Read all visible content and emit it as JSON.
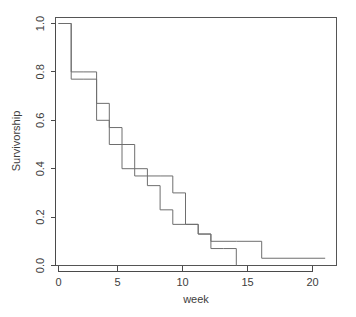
{
  "figure": {
    "name": "survivorship-kaplan-meier-plot",
    "background_color": "#ffffff",
    "line_color": "#6e6e6e",
    "axis_color": "#4a4a4a",
    "width": 356,
    "height": 317
  },
  "chart_data": {
    "type": "line",
    "subtype": "kaplan-meier-step",
    "title": "",
    "subtitle": "",
    "xlabel": "week",
    "ylabel": "Survivorship",
    "xlim": [
      0,
      21.8
    ],
    "ylim": [
      0.0,
      1.0
    ],
    "xticks": [
      0,
      5,
      10,
      15,
      20
    ],
    "xtick_labels": [
      "0",
      "5",
      "10",
      "15",
      "20"
    ],
    "yticks": [
      0.0,
      0.2,
      0.4,
      0.6,
      0.8,
      1.0
    ],
    "ytick_labels": [
      "0.0",
      "0.2",
      "0.4",
      "0.6",
      "0.8",
      "1.0"
    ],
    "grid": false,
    "legend": false,
    "legend_position": "none",
    "series": [
      {
        "name": "group-a",
        "color": "#6e6e6e",
        "step": "post",
        "x": [
          0,
          1,
          2,
          3,
          4,
          5,
          6,
          8,
          9,
          10,
          11,
          12,
          14,
          16,
          21
        ],
        "y": [
          1.0,
          0.8,
          0.8,
          0.67,
          0.57,
          0.5,
          0.37,
          0.37,
          0.3,
          0.17,
          0.13,
          0.1,
          0.1,
          0.03,
          0.03
        ],
        "censored_x": [],
        "censored_y": []
      },
      {
        "name": "group-b",
        "color": "#6e6e6e",
        "step": "post",
        "x": [
          0,
          1,
          2,
          3,
          4,
          5,
          6,
          7,
          8,
          9,
          10,
          11,
          12,
          13,
          14
        ],
        "y": [
          1.0,
          0.77,
          0.77,
          0.6,
          0.5,
          0.4,
          0.4,
          0.33,
          0.23,
          0.17,
          0.17,
          0.13,
          0.07,
          0.07,
          0.07
        ],
        "censored_x": [
          14
        ],
        "censored_y": [
          0.07
        ]
      }
    ],
    "annotations": []
  }
}
